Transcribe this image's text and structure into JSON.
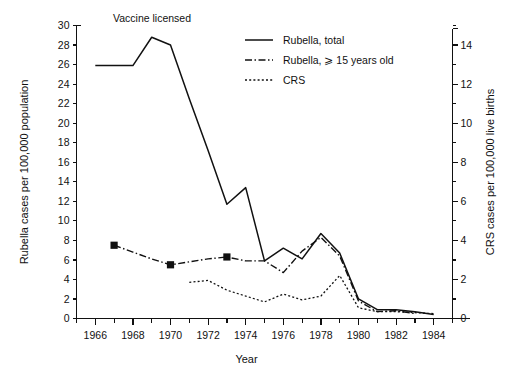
{
  "figure": {
    "annotation": "Vaccine licensed"
  },
  "axes": {
    "x": {
      "title": "Year",
      "min": 1965,
      "max": 1985,
      "tick_labels": [
        "1966",
        "1968",
        "1970",
        "1972",
        "1974",
        "1976",
        "1978",
        "1980",
        "1982",
        "1984"
      ],
      "tick_values": [
        1966,
        1968,
        1970,
        1972,
        1974,
        1976,
        1978,
        1980,
        1982,
        1984
      ],
      "minor_tick_values": [
        1965,
        1967,
        1969,
        1971,
        1973,
        1975,
        1977,
        1979,
        1981,
        1983,
        1985
      ]
    },
    "y_left": {
      "title": "Rubella cases per 100,000 population",
      "min": 0,
      "max": 30,
      "tick_labels": [
        "0",
        "2",
        "4",
        "6",
        "8",
        "10",
        "12",
        "14",
        "16",
        "18",
        "20",
        "22",
        "24",
        "26",
        "28",
        "30"
      ],
      "tick_values": [
        0,
        2,
        4,
        6,
        8,
        10,
        12,
        14,
        16,
        18,
        20,
        22,
        24,
        26,
        28,
        30
      ]
    },
    "y_right": {
      "title": "CRS cases per 100,000 live births",
      "min": 0,
      "max": 15,
      "tick_labels": [
        "0",
        "2",
        "4",
        "6",
        "8",
        "10",
        "12",
        "14"
      ],
      "tick_values": [
        0,
        2,
        4,
        6,
        8,
        10,
        12,
        14
      ],
      "minor_tick_values": [
        1,
        3,
        5,
        7,
        9,
        11,
        13,
        15
      ]
    }
  },
  "legend": {
    "items": [
      {
        "label": "Rubella,  total",
        "style": "solid"
      },
      {
        "label": "Rubella, ⩾ 15 years old",
        "style": "dash-dot"
      },
      {
        "label": "CRS",
        "style": "dotted"
      }
    ]
  },
  "chart_data": {
    "type": "line",
    "title": "",
    "subtitle": "",
    "annotations": [
      {
        "text": "Vaccine licensed",
        "x": 1969,
        "note": "label above peak of total rubella curve"
      }
    ],
    "xlabel": "Year",
    "ylabel": "Rubella cases per 100,000 population",
    "ylabel_right": "CRS cases per 100,000 live births",
    "xlim": [
      1965,
      1985
    ],
    "ylim": [
      0,
      30
    ],
    "ylim_right": [
      0,
      15
    ],
    "grid": false,
    "legend_position": "top-right",
    "series": [
      {
        "name": "Rubella,  total",
        "axis": "left",
        "style": "solid",
        "x": [
          1966,
          1967,
          1968,
          1969,
          1970,
          1971,
          1972,
          1973,
          1974,
          1975,
          1976,
          1977,
          1978,
          1979,
          1980,
          1981,
          1982,
          1983,
          1984
        ],
        "values": [
          25.9,
          25.9,
          25.9,
          28.8,
          28.0,
          22.5,
          17.2,
          11.7,
          13.4,
          5.9,
          7.2,
          6.1,
          8.7,
          6.7,
          2.0,
          0.9,
          0.9,
          0.7,
          0.4
        ]
      },
      {
        "name": "Rubella, ⩾ 15 years old",
        "axis": "left",
        "style": "dash-dot",
        "x": [
          1967,
          1968,
          1969,
          1970,
          1971,
          1972,
          1973,
          1974,
          1975,
          1976,
          1977,
          1978,
          1979,
          1980,
          1981,
          1982,
          1983
        ],
        "values": [
          7.5,
          6.8,
          6.1,
          5.5,
          5.8,
          6.1,
          6.3,
          5.9,
          5.9,
          4.7,
          6.9,
          8.3,
          6.4,
          1.8,
          0.7,
          0.8,
          0.5
        ],
        "markers": [
          {
            "x": 1967,
            "y": 7.5
          },
          {
            "x": 1970,
            "y": 5.5
          },
          {
            "x": 1973,
            "y": 6.3
          }
        ]
      },
      {
        "name": "CRS",
        "axis": "right",
        "style": "dotted",
        "x": [
          1971,
          1972,
          1973,
          1974,
          1975,
          1976,
          1977,
          1978,
          1979,
          1980,
          1981,
          1982,
          1983,
          1984
        ],
        "values": [
          1.85,
          1.95,
          1.45,
          1.15,
          0.85,
          1.25,
          0.95,
          1.15,
          2.2,
          0.55,
          0.35,
          0.35,
          0.3,
          0.25
        ]
      }
    ]
  }
}
